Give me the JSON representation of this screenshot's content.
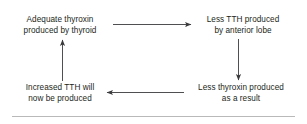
{
  "diagram": {
    "type": "cycle-flow-diagram",
    "stroke_color": "#3b3b3d",
    "text_color": "#231f20",
    "rule_color": "#b9b9ba",
    "nodes": [
      {
        "id": "top-left",
        "lines": [
          "Adequate thyroxin",
          "produced by thyroid"
        ]
      },
      {
        "id": "top-right",
        "lines": [
          "Less TTH produced",
          "by anterior lobe"
        ]
      },
      {
        "id": "bottom-left",
        "lines": [
          "Increased TTH will",
          "now be produced"
        ]
      },
      {
        "id": "bottom-right",
        "lines": [
          "Less thyroxin produced",
          "as a result"
        ]
      }
    ],
    "arrows": [
      {
        "id": "top-arrow",
        "from": "top-left",
        "to": "top-right",
        "direction": "right"
      },
      {
        "id": "right-arrow",
        "from": "top-right",
        "to": "bottom-right",
        "direction": "down"
      },
      {
        "id": "bottom-arrow",
        "from": "bottom-right",
        "to": "bottom-left",
        "direction": "left"
      },
      {
        "id": "left-arrow",
        "from": "bottom-left",
        "to": "top-left",
        "direction": "up"
      }
    ]
  }
}
